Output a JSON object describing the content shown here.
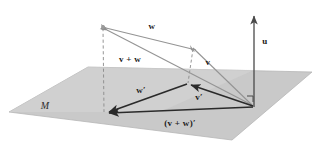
{
  "figure": {
    "type": "vector-projection-diagram",
    "background_color": "#ffffff",
    "plane": {
      "name": "M",
      "label": "M",
      "fill_color": "#c9c9c9",
      "edge_color": "#b0b0b0",
      "label_position": {
        "x": 45,
        "y": 107
      },
      "corners": [
        {
          "x": 9,
          "y": 112
        },
        {
          "x": 88,
          "y": 67
        },
        {
          "x": 312,
          "y": 72
        },
        {
          "x": 232,
          "y": 140
        }
      ]
    },
    "points": {
      "origin": {
        "x": 254,
        "y": 107,
        "label": ""
      },
      "w_tip": {
        "x": 103,
        "y": 27
      },
      "v_tip": {
        "x": 193,
        "y": 48
      },
      "w_prime_tip": {
        "x": 104,
        "y": 113
      },
      "v_prime_tip": {
        "x": 187,
        "y": 84
      },
      "u_tip": {
        "x": 254,
        "y": 13
      }
    },
    "vectors": [
      {
        "id": "w",
        "label": "w",
        "label_position": {
          "x": 152,
          "y": 27
        },
        "from": "origin_w_base",
        "color": "#8a8a8a",
        "style": "solid",
        "head": "start",
        "description": "light gray vector w from v-tip toward upper-left point"
      },
      {
        "id": "v-plus-w",
        "label": "v + w",
        "label_position": {
          "x": 130,
          "y": 60
        },
        "color": "#8a8a8a",
        "style": "solid",
        "head": "start",
        "description": "light gray vector from origin to upper-left point"
      },
      {
        "id": "v",
        "label": "v",
        "label_position": {
          "x": 208,
          "y": 63
        },
        "color": "#8a8a8a",
        "style": "solid",
        "head": "start",
        "description": "light gray vector from origin to v-tip"
      },
      {
        "id": "u",
        "label": "u",
        "label_position": {
          "x": 265,
          "y": 42
        },
        "color": "#5a5a5a",
        "style": "solid",
        "head": "end",
        "description": "dark normal vector pointing straight up from origin"
      },
      {
        "id": "w-prime",
        "label": "w′",
        "label_position": {
          "x": 141,
          "y": 91
        },
        "color": "#333333",
        "style": "solid",
        "head": "end",
        "description": "dark projection of w in the plane"
      },
      {
        "id": "v-prime",
        "label": "v′",
        "label_position": {
          "x": 199,
          "y": 98
        },
        "color": "#333333",
        "style": "solid",
        "head": "end",
        "description": "dark projection of v in the plane"
      },
      {
        "id": "v-plus-w-prime",
        "label": "(v + w)′",
        "label_position": {
          "x": 180,
          "y": 124
        },
        "color": "#333333",
        "style": "solid",
        "head": "end",
        "description": "dark projection of v+w in the plane"
      }
    ],
    "dashed_lines": [
      {
        "id": "dash-left",
        "from": {
          "x": 103,
          "y": 28
        },
        "to": {
          "x": 104,
          "y": 112
        },
        "color": "#8a8a8a"
      },
      {
        "id": "dash-middle",
        "from": {
          "x": 193,
          "y": 49
        },
        "to": {
          "x": 188,
          "y": 83
        },
        "color": "#8a8a8a"
      }
    ],
    "right_angle_marker": {
      "id": "right-angle-at-origin",
      "position": {
        "x": 247,
        "y": 96
      },
      "size": 6,
      "color": "#444444"
    }
  }
}
